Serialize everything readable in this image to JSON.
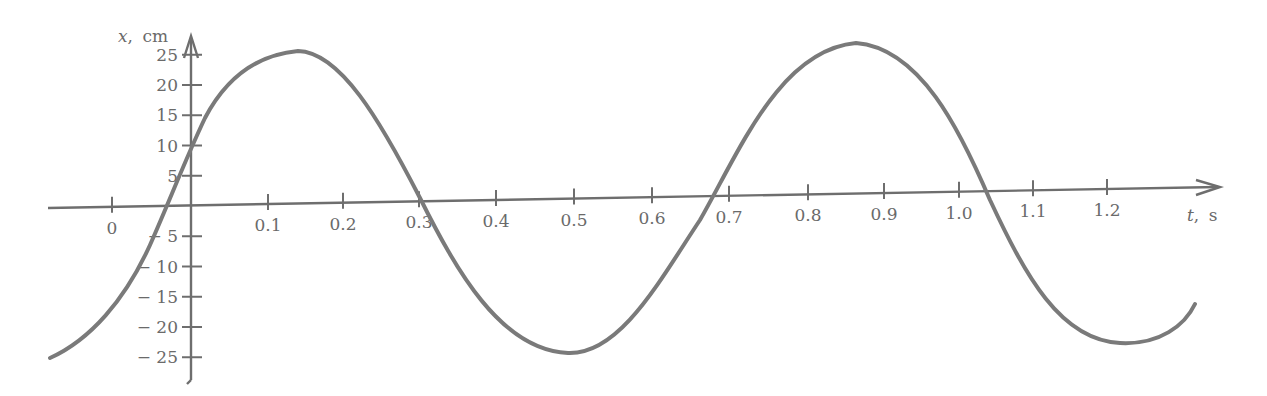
{
  "chart_data": {
    "type": "line",
    "title": "",
    "xlabel": "t, s",
    "ylabel": "x, cm",
    "xlabel_var": "t",
    "xlabel_unit": "s",
    "ylabel_var": "x",
    "ylabel_unit": "cm",
    "grid": false,
    "legend": null,
    "xlim": [
      -0.19,
      1.38
    ],
    "ylim": [
      -28,
      28
    ],
    "x_ticks": [
      {
        "label": "0",
        "px": 112
      },
      {
        "label": "0.1",
        "px": 268
      },
      {
        "label": "0.2",
        "px": 343
      },
      {
        "label": "0.3",
        "px": 419
      },
      {
        "label": "0.4",
        "px": 496
      },
      {
        "label": "0.5",
        "px": 574
      },
      {
        "label": "0.6",
        "px": 652
      },
      {
        "label": "0.7",
        "px": 729
      },
      {
        "label": "0.8",
        "px": 808
      },
      {
        "label": "0.9",
        "px": 884
      },
      {
        "label": "1.0",
        "px": 959
      },
      {
        "label": "1.1",
        "px": 1033
      },
      {
        "label": "1.2",
        "px": 1107
      }
    ],
    "y_ticks": [
      {
        "label": "25",
        "value": 25
      },
      {
        "label": "20",
        "value": 20
      },
      {
        "label": "15",
        "value": 15
      },
      {
        "label": "10",
        "value": 10
      },
      {
        "label": "5",
        "value": 5
      },
      {
        "label": "− 5",
        "value": -5
      },
      {
        "label": "− 10",
        "value": -10
      },
      {
        "label": "− 15",
        "value": -15
      },
      {
        "label": "− 20",
        "value": -20
      },
      {
        "label": "− 25",
        "value": -25
      }
    ],
    "series": [
      {
        "name": "x(t)",
        "description": "Sinusoidal oscillation, amplitude ~25 cm, period ~0.72 s, x(0) ~ 10 cm",
        "x": [
          -0.18,
          -0.12,
          -0.06,
          0.0,
          0.05,
          0.1,
          0.14,
          0.2,
          0.25,
          0.32,
          0.4,
          0.45,
          0.49,
          0.55,
          0.62,
          0.68,
          0.75,
          0.8,
          0.86,
          0.92,
          0.98,
          1.05,
          1.12,
          1.18,
          1.22,
          1.27,
          1.32
        ],
        "y": [
          -25,
          -17,
          0,
          10,
          18,
          24,
          25.5,
          22,
          15,
          0,
          -17,
          -23,
          -24.5,
          -22,
          -12,
          0,
          15,
          23,
          26,
          23,
          14,
          0,
          -15,
          -22,
          -22.5,
          -21.5,
          -16
        ]
      }
    ],
    "annotations": []
  }
}
